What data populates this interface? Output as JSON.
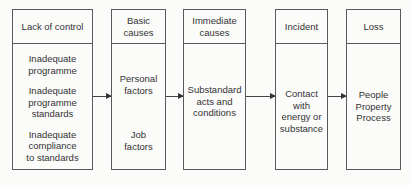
{
  "diagram": {
    "type": "flowchart",
    "stages": [
      {
        "title": "Lack of control",
        "items": [
          "Inadequate\nprogramme",
          "Inadequate\nprogramme\nstandards",
          "Inadequate\ncompliance\nto standards"
        ]
      },
      {
        "title": "Basic\ncauses",
        "items": [
          "Personal\nfactors",
          "Job\nfactors"
        ]
      },
      {
        "title": "Immediate\ncauses",
        "items": [
          "Substandard\nacts and\nconditions"
        ]
      },
      {
        "title": "Incident",
        "items": [
          "Contact\nwith\nenergy or\nsubstance"
        ]
      },
      {
        "title": "Loss",
        "items": [
          "People\nProperty\nProcess"
        ]
      }
    ],
    "connections": [
      {
        "from": "Lack of control",
        "to": "Basic causes"
      },
      {
        "from": "Basic causes",
        "to": "Immediate causes"
      },
      {
        "from": "Immediate causes",
        "to": "Incident"
      },
      {
        "from": "Incident",
        "to": "Loss"
      }
    ]
  }
}
